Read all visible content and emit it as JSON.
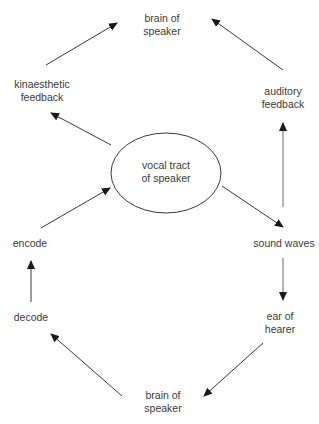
{
  "diagram": {
    "colors": {
      "stroke": "#3a3a3a",
      "text": "#3a3a3a",
      "background": "#ffffff"
    },
    "center_node": {
      "id": "vocal-tract",
      "lines": [
        "vocal tract",
        "of speaker"
      ],
      "shape": "ellipse",
      "cx": 166,
      "cy": 173,
      "rx": 55,
      "ry": 40
    },
    "nodes": [
      {
        "id": "brain-of-speaker-top",
        "lines": [
          "brain of",
          "speaker"
        ],
        "x": 162,
        "y": 19
      },
      {
        "id": "kinaesthetic-feedback",
        "lines": [
          "kinaesthetic",
          "feedback"
        ],
        "x": 42,
        "y": 85
      },
      {
        "id": "auditory-feedback",
        "lines": [
          "auditory",
          "feedback"
        ],
        "x": 283,
        "y": 92
      },
      {
        "id": "encode",
        "lines": [
          "encode"
        ],
        "x": 30,
        "y": 244
      },
      {
        "id": "sound-waves",
        "lines": [
          "sound waves"
        ],
        "x": 284,
        "y": 244
      },
      {
        "id": "decode",
        "lines": [
          "decode"
        ],
        "x": 31,
        "y": 318
      },
      {
        "id": "ear-of-hearer",
        "lines": [
          "ear of",
          "hearer"
        ],
        "x": 280,
        "y": 317
      },
      {
        "id": "brain-of-speaker-bottom",
        "lines": [
          "brain of",
          "speaker"
        ],
        "x": 163,
        "y": 396
      }
    ],
    "edges": [
      {
        "from": "kinaesthetic-feedback",
        "to": "brain-of-speaker-top",
        "x1": 46,
        "y1": 65,
        "x2": 117,
        "y2": 23
      },
      {
        "from": "auditory-feedback",
        "to": "brain-of-speaker-top",
        "x1": 283,
        "y1": 70,
        "x2": 212,
        "y2": 19
      },
      {
        "from": "vocal-tract",
        "to": "kinaesthetic-feedback",
        "x1": 111,
        "y1": 145,
        "x2": 51,
        "y2": 113
      },
      {
        "from": "encode",
        "to": "vocal-tract",
        "x1": 41,
        "y1": 228,
        "x2": 110,
        "y2": 188
      },
      {
        "from": "vocal-tract",
        "to": "sound-waves",
        "x1": 222,
        "y1": 186,
        "x2": 283,
        "y2": 227
      },
      {
        "from": "sound-waves",
        "to": "auditory-feedback",
        "x1": 283,
        "y1": 207,
        "x2": 283,
        "y2": 123,
        "grey": true
      },
      {
        "from": "sound-waves",
        "to": "ear-of-hearer",
        "x1": 283,
        "y1": 258,
        "x2": 283,
        "y2": 300,
        "grey": true
      },
      {
        "from": "decode",
        "to": "encode",
        "x1": 31,
        "y1": 302,
        "x2": 31,
        "y2": 261
      },
      {
        "from": "ear-of-hearer",
        "to": "brain-of-speaker-bottom",
        "x1": 263,
        "y1": 343,
        "x2": 204,
        "y2": 396
      },
      {
        "from": "brain-of-speaker-bottom",
        "to": "decode",
        "x1": 122,
        "y1": 396,
        "x2": 51,
        "y2": 334
      }
    ]
  }
}
